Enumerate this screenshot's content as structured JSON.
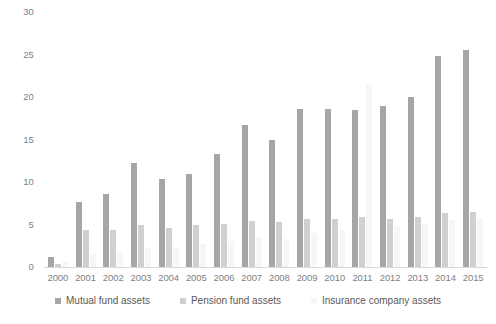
{
  "chart_data": {
    "type": "bar",
    "title": "",
    "subtitle": "",
    "xlabel": "",
    "ylabel": "",
    "ylim": [
      0,
      30
    ],
    "yticks": [
      0,
      5,
      10,
      15,
      20,
      25,
      30
    ],
    "grid": false,
    "legend_position": "bottom",
    "categories": [
      "2000",
      "2001",
      "2002",
      "2003",
      "2004",
      "2005",
      "2006",
      "2007",
      "2008",
      "2009",
      "2010",
      "2011",
      "2012",
      "2013",
      "2014",
      "2015"
    ],
    "series": [
      {
        "name": "Mutual fund assets",
        "color": "#a6a6a6",
        "values": [
          1.2,
          7.6,
          8.6,
          12.2,
          10.4,
          10.9,
          13.3,
          16.7,
          15.0,
          18.6,
          18.6,
          18.5,
          18.9,
          20.0,
          24.8,
          25.5
        ]
      },
      {
        "name": "Pension fund assets",
        "color": "#d0d0d0",
        "values": [
          0.3,
          4.4,
          4.4,
          4.9,
          4.6,
          4.9,
          5.1,
          5.4,
          5.3,
          5.7,
          5.7,
          5.9,
          5.6,
          5.9,
          6.3,
          6.5
        ]
      },
      {
        "name": "Insurance company assets",
        "color": "#f6f6f6",
        "values": [
          0.6,
          1.5,
          1.8,
          2.2,
          2.4,
          2.7,
          3.1,
          3.5,
          3.3,
          4.0,
          4.4,
          21.5,
          4.8,
          5.1,
          5.5,
          5.8
        ]
      }
    ]
  },
  "legend": {
    "items": [
      {
        "label": "Mutual fund assets"
      },
      {
        "label": "Pension fund assets"
      },
      {
        "label": "Insurance company assets"
      }
    ]
  }
}
